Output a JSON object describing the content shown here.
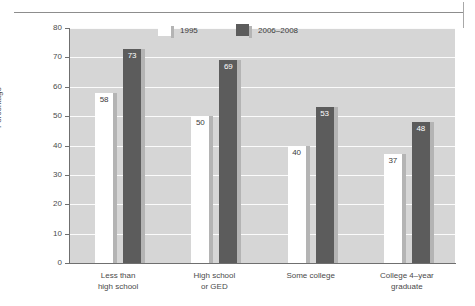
{
  "chart_data": {
    "type": "bar",
    "title": "",
    "xlabel": "",
    "ylabel": "Percentage",
    "ylim": [
      0,
      80
    ],
    "ytick_step": 10,
    "yticks": [
      80,
      70,
      60,
      50,
      40,
      30,
      20,
      10,
      0
    ],
    "grid": "horizontal",
    "legend_position": "top-center",
    "categories": [
      "Less than\nhigh school",
      "High school\nor GED",
      "Some college",
      "College 4–year\ngraduate"
    ],
    "category_lines": [
      [
        "Less than",
        "high school"
      ],
      [
        "High school",
        "or GED"
      ],
      [
        "Some college",
        ""
      ],
      [
        "College 4–year",
        "graduate"
      ]
    ],
    "series": [
      {
        "name": "1995",
        "color": "#ffffff",
        "values": [
          58,
          50,
          40,
          37
        ]
      },
      {
        "name": "2006–2008",
        "color": "#5c5c5c",
        "values": [
          73,
          69,
          53,
          48
        ]
      }
    ],
    "value_labels": [
      [
        58,
        73
      ],
      [
        50,
        69
      ],
      [
        40,
        53
      ],
      [
        37,
        48
      ]
    ]
  },
  "legend": {
    "items": [
      {
        "label": "1995",
        "swatch": "white-swatch"
      },
      {
        "label": "2006–2008",
        "swatch": "dark-swatch"
      }
    ]
  },
  "axes": {
    "y_title": "Percentage"
  },
  "colors": {
    "plot_background": "#d6d6d6",
    "gridline": "#fbfbfb",
    "series_1995": "#ffffff",
    "series_2006_2008": "#5c5c5c",
    "axis": "#6f6f6f",
    "text": "#4a4a4a",
    "shadow": "#b4b4b4"
  }
}
